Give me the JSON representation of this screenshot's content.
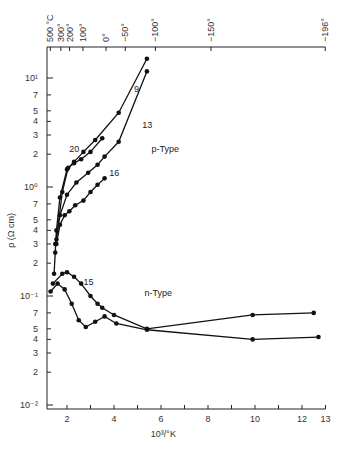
{
  "chart_data": {
    "type": "line",
    "title": "",
    "xlabel": "10³/°K",
    "ylabel": "ρ (Ω cm)",
    "xlim": [
      1.2,
      13
    ],
    "ylim": [
      0.01,
      20
    ],
    "yscale": "log",
    "grid": false,
    "x_ticks": [
      {
        "v": 2,
        "label": "2"
      },
      {
        "v": 3,
        "label": ""
      },
      {
        "v": 4,
        "label": "4"
      },
      {
        "v": 5,
        "label": ""
      },
      {
        "v": 6,
        "label": "6"
      },
      {
        "v": 7,
        "label": ""
      },
      {
        "v": 8,
        "label": "8"
      },
      {
        "v": 9,
        "label": ""
      },
      {
        "v": 10,
        "label": "10"
      },
      {
        "v": 11,
        "label": ""
      },
      {
        "v": 12,
        "label": "12"
      },
      {
        "v": 13,
        "label": "13"
      }
    ],
    "y_ticks": [
      {
        "v": 0.01,
        "label": "10⁻²"
      },
      {
        "v": 0.02,
        "label": "2"
      },
      {
        "v": 0.03,
        "label": "3"
      },
      {
        "v": 0.04,
        "label": "4"
      },
      {
        "v": 0.05,
        "label": "5"
      },
      {
        "v": 0.07,
        "label": "7"
      },
      {
        "v": 0.1,
        "label": "10⁻¹"
      },
      {
        "v": 0.2,
        "label": "2"
      },
      {
        "v": 0.3,
        "label": "3"
      },
      {
        "v": 0.4,
        "label": "4"
      },
      {
        "v": 0.5,
        "label": "5"
      },
      {
        "v": 0.7,
        "label": "7"
      },
      {
        "v": 1,
        "label": "10⁰"
      },
      {
        "v": 2,
        "label": "2"
      },
      {
        "v": 3,
        "label": "3"
      },
      {
        "v": 4,
        "label": "4"
      },
      {
        "v": 5,
        "label": "5"
      },
      {
        "v": 7,
        "label": "7"
      },
      {
        "v": 10,
        "label": "10¹"
      }
    ],
    "top_axis": {
      "label_unit": "°C",
      "ticks": [
        {
          "x": 1.29,
          "label": "500 °C"
        },
        {
          "x": 1.74,
          "label": "300°"
        },
        {
          "x": 2.11,
          "label": "200°"
        },
        {
          "x": 2.68,
          "label": "100°"
        },
        {
          "x": 3.66,
          "label": "0°"
        },
        {
          "x": 4.48,
          "label": "−50°"
        },
        {
          "x": 5.76,
          "label": "−100°"
        },
        {
          "x": 8.13,
          "label": "−150°"
        },
        {
          "x": 12.99,
          "label": "−196°"
        }
      ]
    },
    "series": [
      {
        "name": "9",
        "group": "p-Type",
        "points": [
          [
            1.45,
            0.16
          ],
          [
            1.5,
            0.25
          ],
          [
            1.55,
            0.4
          ],
          [
            1.7,
            0.8
          ],
          [
            2.0,
            1.45
          ],
          [
            2.3,
            1.7
          ],
          [
            2.7,
            2.1
          ],
          [
            3.2,
            2.7
          ],
          [
            4.2,
            4.8
          ],
          [
            5.4,
            15
          ]
        ]
      },
      {
        "name": "13",
        "group": "p-Type",
        "points": [
          [
            1.5,
            0.3
          ],
          [
            1.7,
            0.55
          ],
          [
            2.0,
            0.85
          ],
          [
            2.4,
            1.1
          ],
          [
            2.9,
            1.35
          ],
          [
            3.3,
            1.6
          ],
          [
            3.6,
            1.9
          ],
          [
            4.2,
            2.6
          ],
          [
            5.4,
            11.5
          ]
        ]
      },
      {
        "name": "20",
        "group": "p-Type",
        "points": [
          [
            1.55,
            0.33
          ],
          [
            1.8,
            0.9
          ],
          [
            2.05,
            1.5
          ],
          [
            2.3,
            1.65
          ],
          [
            2.6,
            1.8
          ],
          [
            3.0,
            2.1
          ],
          [
            3.5,
            2.8
          ]
        ]
      },
      {
        "name": "16",
        "group": "p-Type",
        "points": [
          [
            1.55,
            0.3
          ],
          [
            1.7,
            0.45
          ],
          [
            1.9,
            0.55
          ],
          [
            2.1,
            0.6
          ],
          [
            2.35,
            0.68
          ],
          [
            2.7,
            0.75
          ],
          [
            3.0,
            0.9
          ],
          [
            3.3,
            1.05
          ],
          [
            3.6,
            1.2
          ]
        ]
      },
      {
        "name": "15 (upper)",
        "group": "n-Type",
        "points": [
          [
            1.4,
            0.13
          ],
          [
            1.8,
            0.16
          ],
          [
            2.0,
            0.165
          ],
          [
            2.3,
            0.15
          ],
          [
            2.6,
            0.13
          ],
          [
            3.0,
            0.1
          ],
          [
            3.3,
            0.085
          ],
          [
            3.5,
            0.078
          ],
          [
            4.0,
            0.067
          ],
          [
            5.4,
            0.05
          ],
          [
            9.9,
            0.067
          ],
          [
            12.5,
            0.07
          ]
        ]
      },
      {
        "name": "15 (lower)",
        "group": "n-Type",
        "points": [
          [
            1.3,
            0.11
          ],
          [
            1.6,
            0.13
          ],
          [
            1.9,
            0.115
          ],
          [
            2.2,
            0.085
          ],
          [
            2.5,
            0.06
          ],
          [
            2.8,
            0.052
          ],
          [
            3.2,
            0.058
          ],
          [
            3.6,
            0.065
          ],
          [
            4.1,
            0.056
          ],
          [
            5.4,
            0.049
          ],
          [
            9.9,
            0.04
          ],
          [
            12.7,
            0.042
          ]
        ]
      }
    ],
    "annotations": [
      {
        "text": "9",
        "x": 4.85,
        "y": 7.5
      },
      {
        "text": "13",
        "x": 5.2,
        "y": 3.5
      },
      {
        "text": "20",
        "x": 2.1,
        "y": 2.1
      },
      {
        "text": "16",
        "x": 3.8,
        "y": 1.25
      },
      {
        "text": "p-Type",
        "x": 5.6,
        "y": 2.1
      },
      {
        "text": "15",
        "x": 2.7,
        "y": 0.125
      },
      {
        "text": "n-Type",
        "x": 5.3,
        "y": 0.1
      }
    ]
  }
}
